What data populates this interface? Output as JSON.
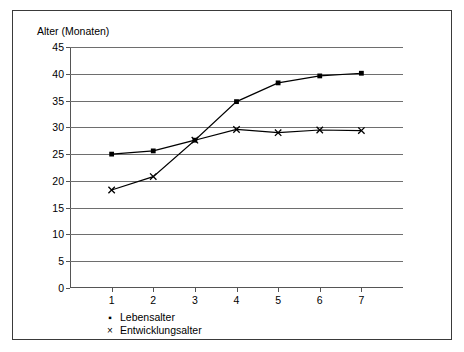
{
  "chart_data": {
    "type": "line",
    "title": "",
    "ylabel": "Alter (Monaten)",
    "xlabel": "",
    "x": [
      1,
      2,
      3,
      4,
      5,
      6,
      7
    ],
    "xtick_labels": [
      "1",
      "2",
      "3",
      "4",
      "5",
      "6",
      "7"
    ],
    "ylim": [
      0,
      45
    ],
    "ytick_labels": [
      "0",
      "5",
      "10",
      "15",
      "20",
      "25",
      "30",
      "35",
      "40",
      "45"
    ],
    "yticks": [
      0,
      5,
      10,
      15,
      20,
      25,
      30,
      35,
      40,
      45
    ],
    "grid": "horizontal",
    "legend_position": "bottom-left",
    "series": [
      {
        "name": "Lebensalter",
        "marker": "square",
        "marker_glyph": "▪",
        "color": "#000000",
        "values": [
          25.0,
          25.6,
          27.6,
          34.8,
          38.3,
          39.6,
          40.1
        ]
      },
      {
        "name": "Entwicklungsalter",
        "marker": "x",
        "marker_glyph": "×",
        "color": "#000000",
        "values": [
          18.3,
          20.8,
          27.6,
          29.6,
          29.0,
          29.5,
          29.4
        ]
      }
    ]
  }
}
